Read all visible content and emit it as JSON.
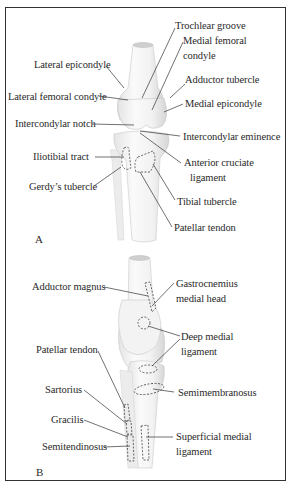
{
  "figure": {
    "panel_a": {
      "letter": "A",
      "labels": {
        "trochlear_groove": "Trochlear groove",
        "medial_femoral_condyle_1": "Medial femoral",
        "medial_femoral_condyle_2": "condyle",
        "lateral_epicondyle": "Lateral epicondyle",
        "adductor_tubercle": "Adductor tubercle",
        "lateral_femoral_condyle": "Lateral femoral condyle",
        "medial_epicondyle": "Medial epicondyle",
        "intercondylar_notch": "Intercondylar notch",
        "intercondylar_eminence": "Intercondylar eminence",
        "iliotibial_tract": "Iliotibial tract",
        "anterior_cruciate_1": "Anterior cruciate",
        "anterior_cruciate_2": "ligament",
        "gerdys_tubercle": "Gerdy’s tubercle",
        "tibial_tubercle": "Tibial tubercle",
        "patellar_tendon": "Patellar tendon"
      }
    },
    "panel_b": {
      "letter": "B",
      "labels": {
        "adductor_magnus": "Adductor magnus",
        "gastrocnemius_1": "Gastrocnemius",
        "gastrocnemius_2": "medial head",
        "deep_medial_1": "Deep medial",
        "deep_medial_2": "ligament",
        "patellar_tendon": "Patellar tendon",
        "sartorius": "Sartorius",
        "semimembranosus": "Semimembranosus",
        "gracilis": "Gracilis",
        "superficial_medial_1": "Superficial medial",
        "superficial_medial_2": "ligament",
        "semitendinosus": "Semitendinosus"
      }
    }
  }
}
